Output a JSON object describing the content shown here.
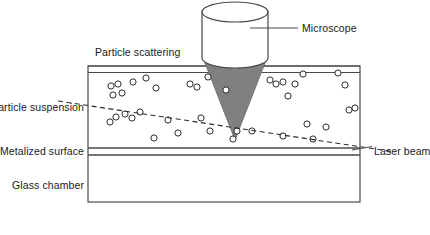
{
  "figure": {
    "background_color": "#ffffff",
    "line_color": "#3a3a3a",
    "cone_fill_color": "#808080",
    "cylinder_fill_color": "#ffffff",
    "particle_stroke_color": "#2b2b2b"
  },
  "labels": {
    "microscope": "Microscope",
    "particle_scattering": "Particle scattering",
    "particle_suspension": "Particle suspension",
    "metalized_surface": "Metalized surface",
    "glass_chamber": "Glass chamber",
    "laser_beam": "Laser beam"
  },
  "components": {
    "microscope_objective": {
      "name": "microscope-objective",
      "cylinder": {
        "cx": 235,
        "top_y": 12,
        "bottom_y": 58,
        "rx": 33,
        "ry": 10
      },
      "cone": {
        "apex_x": 235,
        "apex_y": 140,
        "left_x": 203,
        "right_x": 267,
        "top_y": 58
      }
    },
    "chamber": {
      "outer": {
        "x": 88,
        "y": 66,
        "width": 272,
        "height": 136
      },
      "top_band": {
        "y_top": 66,
        "y_bottom": 72
      },
      "metalized_band": {
        "y_top": 148,
        "y_bottom": 155
      },
      "suspension_region": {
        "y_top": 72,
        "y_bottom": 148
      }
    },
    "laser_beam": {
      "name": "laser-beam-line",
      "style": "dashed",
      "x1": 58,
      "y1": 101,
      "x2": 395,
      "y2": 152
    }
  },
  "leader_lines": {
    "microscope": {
      "x1": 250,
      "y1": 28,
      "x2": 298,
      "y2": 28
    },
    "laser_beam": {
      "x1": 352,
      "y1": 150,
      "x2": 372,
      "y2": 147
    }
  },
  "particles": {
    "radius": 3.1,
    "count": 38,
    "points": [
      [
        111,
        86
      ],
      [
        118,
        84
      ],
      [
        122,
        93
      ],
      [
        113,
        95
      ],
      [
        133,
        82
      ],
      [
        146,
        78
      ],
      [
        156,
        88
      ],
      [
        190,
        84
      ],
      [
        197,
        87
      ],
      [
        208,
        77
      ],
      [
        226,
        90
      ],
      [
        270,
        80
      ],
      [
        276,
        84
      ],
      [
        283,
        82
      ],
      [
        295,
        84
      ],
      [
        303,
        74
      ],
      [
        338,
        73
      ],
      [
        345,
        85
      ],
      [
        288,
        96
      ],
      [
        355,
        108
      ],
      [
        349,
        110
      ],
      [
        116,
        117
      ],
      [
        125,
        114
      ],
      [
        132,
        118
      ],
      [
        140,
        112
      ],
      [
        110,
        122
      ],
      [
        168,
        120
      ],
      [
        201,
        118
      ],
      [
        210,
        131
      ],
      [
        178,
        133
      ],
      [
        237,
        131
      ],
      [
        252,
        131
      ],
      [
        283,
        136
      ],
      [
        307,
        124
      ],
      [
        326,
        127
      ],
      [
        154,
        138
      ],
      [
        233,
        139
      ],
      [
        313,
        139
      ]
    ]
  },
  "annotations": [
    {
      "name": "label-particle-scattering",
      "text_key": "particle_scattering",
      "x": 95,
      "y": 56,
      "anchor": "start"
    },
    {
      "name": "label-microscope",
      "text_key": "microscope",
      "x": 302,
      "y": 32,
      "anchor": "start"
    },
    {
      "name": "label-particle-suspension",
      "text_key": "particle_suspension",
      "x": 84,
      "y": 111,
      "anchor": "end"
    },
    {
      "name": "label-metalized-surface",
      "text_key": "metalized_surface",
      "x": 84,
      "y": 155,
      "anchor": "end"
    },
    {
      "name": "label-glass-chamber",
      "text_key": "glass_chamber",
      "x": 84,
      "y": 189,
      "anchor": "end"
    },
    {
      "name": "label-laser-beam",
      "text_key": "laser_beam",
      "x": 374,
      "y": 155,
      "anchor": "start"
    }
  ]
}
